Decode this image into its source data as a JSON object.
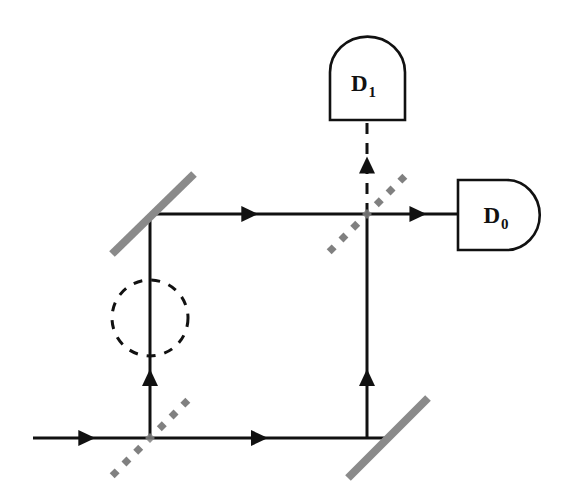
{
  "figure": {
    "background_color": "#ffffff",
    "beam_color": "#111111",
    "mirror_color": "#8a8a8a",
    "beamsplitter_color": "#808080",
    "phase_shifter_color": "#111111",
    "width": 571,
    "height": 500
  },
  "detectors": [
    {
      "id": "D1",
      "label": "D",
      "subscript": "1",
      "shape": "dome-up",
      "x": 330,
      "y": 40,
      "width": 75,
      "height": 80
    },
    {
      "id": "D0",
      "label": "D",
      "subscript": "0",
      "shape": "dome-right",
      "x": 458,
      "y": 180,
      "width": 80,
      "height": 70
    }
  ],
  "mirrors": [
    {
      "id": "mirror-top-left",
      "x1": 112,
      "y1": 254,
      "x2": 194,
      "y2": 174,
      "thickness": 8
    },
    {
      "id": "mirror-bottom-right",
      "x1": 348,
      "y1": 478,
      "x2": 428,
      "y2": 398,
      "thickness": 8
    }
  ],
  "beam_splitters": [
    {
      "id": "bs-input",
      "cx": 150,
      "cy": 438,
      "half_length": 50,
      "dot_count": 7,
      "dot_size": 7
    },
    {
      "id": "bs-output",
      "cx": 367,
      "cy": 214,
      "half_length": 50,
      "dot_count": 7,
      "dot_size": 7
    }
  ],
  "phase_shifter": {
    "id": "phase-shifter-circle",
    "cx": 150,
    "cy": 318,
    "r": 38,
    "dash": "9 9",
    "stroke_width": 3
  },
  "beam_paths": [
    {
      "id": "input-beam",
      "x1": 33,
      "y1": 438,
      "x2": 150,
      "y2": 438,
      "style": "solid",
      "arrow_at": 0.46,
      "arrow_dir": "right"
    },
    {
      "id": "lower-arm",
      "x1": 150,
      "y1": 438,
      "x2": 388,
      "y2": 438,
      "style": "solid",
      "arrow_at": 0.46,
      "arrow_dir": "right"
    },
    {
      "id": "left-vertical-arm",
      "x1": 150,
      "y1": 438,
      "x2": 150,
      "y2": 214,
      "style": "solid",
      "arrow_at": 0.27,
      "arrow_dir": "up"
    },
    {
      "id": "upper-arm",
      "x1": 150,
      "y1": 214,
      "x2": 367,
      "y2": 214,
      "style": "solid",
      "arrow_at": 0.46,
      "arrow_dir": "right"
    },
    {
      "id": "right-vertical-arm",
      "x1": 367,
      "y1": 438,
      "x2": 367,
      "y2": 214,
      "style": "solid",
      "arrow_at": 0.27,
      "arrow_dir": "up"
    },
    {
      "id": "output-to-D0",
      "x1": 367,
      "y1": 214,
      "x2": 458,
      "y2": 214,
      "style": "solid",
      "arrow_at": 0.56,
      "arrow_dir": "right"
    },
    {
      "id": "output-to-D1",
      "x1": 367,
      "y1": 214,
      "x2": 367,
      "y2": 120,
      "style": "dashed",
      "arrow_at": 0.52,
      "arrow_dir": "up"
    }
  ]
}
